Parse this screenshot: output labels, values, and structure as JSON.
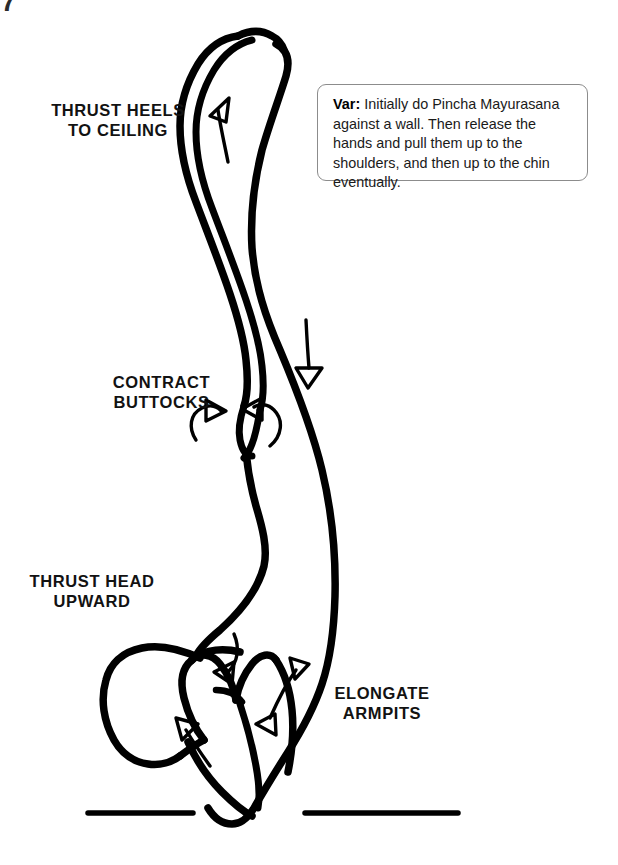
{
  "page": {
    "corner_fragment": "7",
    "background_color": "#ffffff",
    "ink_color": "#000000"
  },
  "illustration": {
    "name": "pincha-mayurasana-forearm-balance",
    "description": "Line drawing of a person in an inverted forearm balance pose, seen from the side, with instructional arrows and a ground line.",
    "ground_lines": [
      {
        "name": "ground-line-left",
        "x1": 88,
        "y1": 813,
        "x2": 193,
        "y2": 813
      },
      {
        "name": "ground-line-right",
        "x1": 305,
        "y1": 813,
        "x2": 458,
        "y2": 813
      }
    ],
    "arrows": [
      {
        "name": "arrow-heels-up",
        "direction": "up",
        "meaning": "thrust heels to ceiling"
      },
      {
        "name": "arrow-leg-down",
        "direction": "down",
        "meaning": "lengthen down the front body"
      },
      {
        "name": "arrow-buttock-left",
        "direction": "curved-inward-left",
        "meaning": "contract buttocks"
      },
      {
        "name": "arrow-buttock-right",
        "direction": "curved-inward-right",
        "meaning": "contract buttocks"
      },
      {
        "name": "arrow-head-up",
        "direction": "up-left",
        "meaning": "thrust head upward"
      },
      {
        "name": "arrow-shoulder-down",
        "direction": "down-left",
        "meaning": "draw shoulder down"
      },
      {
        "name": "arrow-armpit-double",
        "direction": "double-headed-diagonal",
        "meaning": "elongate armpits"
      }
    ]
  },
  "labels": [
    {
      "id": "label-heels",
      "name": "cue-label-thrust-heels",
      "text": "THRUST HEELS\nTO CEILING"
    },
    {
      "id": "label-buttocks",
      "name": "cue-label-contract-buttocks",
      "text": "CONTRACT\nBUTTOCKS"
    },
    {
      "id": "label-head",
      "name": "cue-label-thrust-head",
      "text": "THRUST HEAD\nUPWARD"
    },
    {
      "id": "label-armpits",
      "name": "cue-label-elongate-armpits",
      "text": "ELONGATE\nARMPITS"
    }
  ],
  "variation_note": {
    "prefix": "Var:",
    "body": " Initially do Pincha Mayurasana against a wall. Then release the hands and pull them up to the shoulders, and then up to the chin eventually.",
    "border_color": "#8c8c8c"
  }
}
